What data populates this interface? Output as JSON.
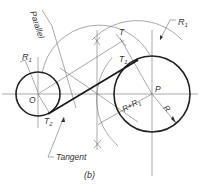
{
  "figure": {
    "caption": "(b)",
    "labels": {
      "parallel": "Parallel",
      "tangent": "Tangent",
      "r1_small": "R",
      "r1_small_sub": "1",
      "r1_large": "R",
      "r1_large_sub": "1",
      "r": "R",
      "r_plus_r1": "R+R",
      "r_plus_r1_sub": "1",
      "t": "T",
      "t1": "T",
      "t1_sub": "1",
      "t2": "T",
      "t2_sub": "2",
      "center_o": "O",
      "center_p": "P"
    },
    "colors": {
      "line_dark": "#222222",
      "line_light": "#6e6e6e",
      "background": "#ffffff"
    }
  }
}
